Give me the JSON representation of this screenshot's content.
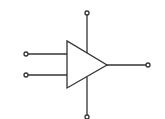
{
  "diagram": {
    "type": "op-amp-symbol",
    "stroke_color": "#333333",
    "background": "#ffffff",
    "terminals": [
      "input-1",
      "input-2",
      "output",
      "supply-top",
      "supply-bottom"
    ]
  }
}
